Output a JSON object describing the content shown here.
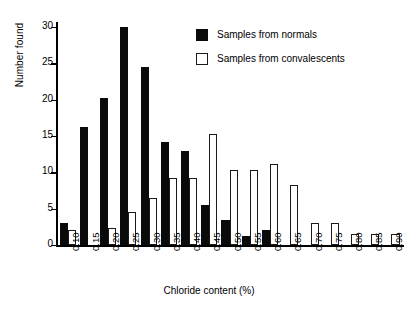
{
  "chart_data": {
    "type": "bar",
    "title": "",
    "xlabel": "Chloride content (%)",
    "ylabel": "Number found",
    "categories": [
      "0.10",
      "0.15",
      "0.20",
      "0.25",
      "0.30",
      "0.35",
      "0.40",
      "0.45",
      "0.50",
      "0.55",
      "0.60",
      "0.65",
      "0.70",
      "0.75",
      "0.80",
      "0.85",
      "0.90"
    ],
    "series": [
      {
        "name": "Samples from normals",
        "style": "filled",
        "color": "#0a0a0a",
        "values": [
          3,
          16.3,
          20.2,
          30,
          24.5,
          14.2,
          13,
          5.5,
          3.5,
          1.3,
          2,
          0,
          0,
          0,
          0,
          0,
          0
        ]
      },
      {
        "name": "Samples from convalescents",
        "style": "open",
        "color": "#ffffff",
        "values": [
          2,
          0,
          2.3,
          4.5,
          6.5,
          9.2,
          9.2,
          15.3,
          10.3,
          10.3,
          11.2,
          8.3,
          3,
          3,
          1.5,
          1.5,
          1.5
        ]
      }
    ],
    "ylim": [
      0,
      30.7
    ],
    "yticks": [
      0,
      5,
      10,
      15,
      20,
      25,
      30
    ],
    "ytick_labels": [
      "0",
      "5",
      "10",
      "15",
      "20",
      "25",
      "30"
    ],
    "grid": false,
    "legend_position": "top-right"
  },
  "legend": {
    "items": [
      {
        "label": "Samples from normals",
        "swatch": "filled-square-icon"
      },
      {
        "label": "Samples from convalescents",
        "swatch": "open-square-icon"
      }
    ]
  },
  "axes": {
    "x_title": "Chloride content (%)",
    "y_title": "Number found"
  }
}
